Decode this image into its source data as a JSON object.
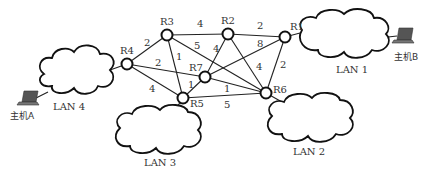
{
  "diagram": {
    "type": "network-topology",
    "routers": [
      {
        "id": "R1",
        "label": "R1",
        "x": 285,
        "y": 37
      },
      {
        "id": "R2",
        "label": "R2",
        "x": 228,
        "y": 34
      },
      {
        "id": "R3",
        "label": "R3",
        "x": 167,
        "y": 35
      },
      {
        "id": "R4",
        "label": "R4",
        "x": 127,
        "y": 64
      },
      {
        "id": "R5",
        "label": "R5",
        "x": 183,
        "y": 98
      },
      {
        "id": "R6",
        "label": "R6",
        "x": 266,
        "y": 93
      },
      {
        "id": "R7",
        "label": "R7",
        "x": 205,
        "y": 77
      }
    ],
    "links": [
      {
        "from": "R4",
        "to": "R3",
        "weight": "2"
      },
      {
        "from": "R4",
        "to": "R7",
        "weight": "2"
      },
      {
        "from": "R4",
        "to": "R5",
        "weight": "4"
      },
      {
        "from": "R3",
        "to": "R2",
        "weight": "4"
      },
      {
        "from": "R3",
        "to": "R5",
        "weight": "1"
      },
      {
        "from": "R3",
        "to": "R6",
        "weight": "5"
      },
      {
        "from": "R2",
        "to": "R1",
        "weight": "2"
      },
      {
        "from": "R2",
        "to": "R7",
        "weight": "4"
      },
      {
        "from": "R2",
        "to": "R6",
        "weight": "4"
      },
      {
        "from": "R7",
        "to": "R1",
        "weight": "8"
      },
      {
        "from": "R7",
        "to": "R5",
        "weight": "1"
      },
      {
        "from": "R7",
        "to": "R6",
        "weight": "1"
      },
      {
        "from": "R1",
        "to": "R6",
        "weight": "2"
      },
      {
        "from": "R5",
        "to": "R6",
        "weight": "5"
      }
    ],
    "lans": [
      {
        "id": "LAN1",
        "label": "LAN 1",
        "router": "R1"
      },
      {
        "id": "LAN2",
        "label": "LAN 2",
        "router": "R6"
      },
      {
        "id": "LAN3",
        "label": "LAN 3",
        "router": "R5"
      },
      {
        "id": "LAN4",
        "label": "LAN 4",
        "router": "R4"
      }
    ],
    "hosts": [
      {
        "id": "hostA",
        "label": "主机A",
        "lan": "LAN4"
      },
      {
        "id": "hostB",
        "label": "主机B",
        "lan": "LAN1"
      }
    ]
  }
}
